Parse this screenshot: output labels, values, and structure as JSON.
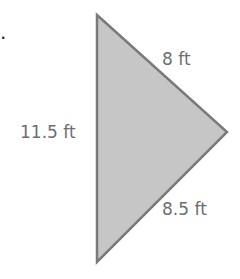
{
  "figure": {
    "bullet": ".",
    "shape": "triangle",
    "fill_color": "#c8c8c8",
    "stroke_color": "#777777",
    "sides": [
      {
        "name": "left",
        "label": "11.5 ft"
      },
      {
        "name": "upper-right",
        "label": "8 ft"
      },
      {
        "name": "lower-right",
        "label": "8.5 ft"
      }
    ]
  }
}
